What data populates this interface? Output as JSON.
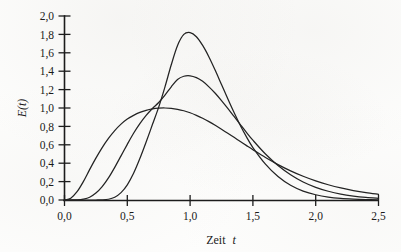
{
  "figure": {
    "name": "residence-time-distribution-plot",
    "background_color": "#fdfdfc",
    "ink_color": "#232323"
  },
  "chart_data": {
    "type": "line",
    "title": "",
    "subtitle": "",
    "xlabel_text": "Zeit",
    "xlabel_variable": "t",
    "ylabel": "E(t)",
    "xlim": [
      0.0,
      2.5
    ],
    "ylim": [
      0.0,
      2.0
    ],
    "grid": false,
    "legend": false,
    "legend_position": "none",
    "xticks": [
      0.0,
      0.5,
      1.0,
      1.5,
      2.0,
      2.5
    ],
    "xticklabels": [
      "0,0",
      "0,5",
      "1,0",
      "1,5",
      "2,0",
      "2,5"
    ],
    "yticks": [
      0.0,
      0.2,
      0.4,
      0.6,
      0.8,
      1.0,
      1.2,
      1.4,
      1.6,
      1.8,
      2.0
    ],
    "yticklabels": [
      "0,0",
      "0,2",
      "0,4",
      "0,6",
      "0,8",
      "1,0",
      "1,2",
      "1,4",
      "1,6",
      "1,8",
      "2,0"
    ],
    "decimal_separator": ",",
    "x": [
      0.0,
      0.05,
      0.1,
      0.15,
      0.2,
      0.25,
      0.3,
      0.35,
      0.4,
      0.45,
      0.5,
      0.55,
      0.6,
      0.65,
      0.7,
      0.75,
      0.8,
      0.85,
      0.9,
      0.95,
      1.0,
      1.05,
      1.1,
      1.15,
      1.2,
      1.25,
      1.3,
      1.35,
      1.4,
      1.45,
      1.5,
      1.6,
      1.7,
      1.8,
      1.9,
      2.0,
      2.1,
      2.2,
      2.3,
      2.4,
      2.5
    ],
    "series": [
      {
        "name": "curve-broad-peak-1.0",
        "peak_value": 1.0,
        "peak_x": 0.78,
        "onset_x": 0.06,
        "values": [
          0.0,
          0.02,
          0.09,
          0.2,
          0.33,
          0.455,
          0.57,
          0.67,
          0.755,
          0.825,
          0.88,
          0.92,
          0.952,
          0.975,
          0.99,
          0.998,
          1.0,
          0.996,
          0.986,
          0.97,
          0.948,
          0.92,
          0.888,
          0.852,
          0.812,
          0.77,
          0.726,
          0.681,
          0.636,
          0.591,
          0.547,
          0.462,
          0.385,
          0.317,
          0.258,
          0.208,
          0.166,
          0.131,
          0.103,
          0.08,
          0.062
        ]
      },
      {
        "name": "curve-medium-peak-1.35",
        "peak_value": 1.35,
        "peak_x": 0.88,
        "onset_x": 0.2,
        "values": [
          0.0,
          0.0,
          0.002,
          0.01,
          0.03,
          0.075,
          0.145,
          0.24,
          0.355,
          0.48,
          0.605,
          0.725,
          0.83,
          0.92,
          0.995,
          1.06,
          1.14,
          1.23,
          1.31,
          1.345,
          1.35,
          1.33,
          1.29,
          1.23,
          1.16,
          1.08,
          0.995,
          0.908,
          0.82,
          0.733,
          0.65,
          0.5,
          0.375,
          0.275,
          0.196,
          0.138,
          0.095,
          0.064,
          0.043,
          0.028,
          0.018
        ]
      },
      {
        "name": "curve-narrow-peak-1.82",
        "peak_value": 1.82,
        "peak_x": 0.93,
        "onset_x": 0.33,
        "values": [
          0.0,
          0.0,
          0.0,
          0.0,
          0.0,
          0.0,
          0.001,
          0.008,
          0.03,
          0.08,
          0.165,
          0.29,
          0.45,
          0.63,
          0.82,
          1.01,
          1.23,
          1.47,
          1.68,
          1.8,
          1.82,
          1.775,
          1.68,
          1.555,
          1.41,
          1.255,
          1.1,
          0.95,
          0.81,
          0.683,
          0.57,
          0.39,
          0.255,
          0.16,
          0.097,
          0.057,
          0.032,
          0.018,
          0.01,
          0.005,
          0.002
        ]
      }
    ]
  },
  "axes": {
    "x_axis_name": "x-axis",
    "y_axis_name": "y-axis"
  }
}
